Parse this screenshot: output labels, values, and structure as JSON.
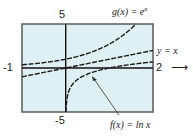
{
  "chart_data": {
    "type": "line",
    "title": "",
    "xlabel": "",
    "ylabel": "",
    "xlim": [
      -1,
      2
    ],
    "ylim": [
      -5,
      5
    ],
    "grid": false,
    "window_labels": {
      "xmin": "-1",
      "xmax": "2",
      "ymin": "-5",
      "ymax": "5"
    },
    "arrow_right": "⟶",
    "series": [
      {
        "name": "g(x) = e^x",
        "label": "g(x) = e",
        "label_sup": "x",
        "style": "dashed",
        "x": [
          -1,
          -0.5,
          0,
          0.5,
          1,
          1.5,
          1.609
        ],
        "y": [
          0.368,
          0.607,
          1,
          1.649,
          2.718,
          4.482,
          5
        ]
      },
      {
        "name": "y = x",
        "label": "y = x",
        "style": "dashed",
        "x": [
          -1,
          0,
          1,
          2
        ],
        "y": [
          -1,
          0,
          1,
          2
        ]
      },
      {
        "name": "f(x) = ln x",
        "label": "f(x) = ln x",
        "style": "dashed",
        "x": [
          0.0067,
          0.05,
          0.1,
          0.25,
          0.5,
          1,
          1.5,
          2
        ],
        "y": [
          -5,
          -3.0,
          -2.303,
          -1.386,
          -0.693,
          0,
          0.405,
          0.693
        ]
      }
    ],
    "annotations": [
      {
        "text": "f(x) = ln x",
        "arrow_to": [
          0.6,
          -0.5
        ]
      }
    ]
  },
  "screen": {
    "background": "#dff0f5",
    "frame": "#555555",
    "curve": "#1a1a1a"
  }
}
